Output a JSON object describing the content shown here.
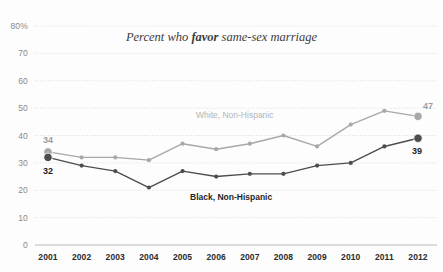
{
  "chart_data": {
    "type": "line",
    "title": "Percent who favor same-sex marriage",
    "title_prefix": "Percent who ",
    "title_emphasis": "favor",
    "title_suffix": " same-sex marriage",
    "xlabel": "",
    "ylabel": "",
    "categories": [
      "2001",
      "2002",
      "2003",
      "2004",
      "2005",
      "2006",
      "2007",
      "2008",
      "2009",
      "2010",
      "2011",
      "2012"
    ],
    "ylim": [
      0,
      80
    ],
    "yticks": [
      "0",
      "10",
      "20",
      "30",
      "40",
      "50",
      "60",
      "70",
      "80%"
    ],
    "ytick_values": [
      0,
      10,
      20,
      30,
      40,
      50,
      60,
      70,
      80
    ],
    "grid": true,
    "legend_position": "inline",
    "series": [
      {
        "name": "White, Non-Hispanic",
        "color": "#a8a8a8",
        "values": [
          34,
          32,
          32,
          31,
          37,
          35,
          37,
          40,
          36,
          44,
          49,
          47
        ],
        "start_label": "34",
        "end_label": "47"
      },
      {
        "name": "Black, Non-Hispanic",
        "color": "#4d4d4d",
        "values": [
          32,
          29,
          27,
          21,
          27,
          25,
          26,
          26,
          29,
          30,
          36,
          39
        ],
        "start_label": "32",
        "end_label": "39"
      }
    ],
    "annotations": [
      {
        "text": "White, Non-Hispanic",
        "color": "#b4b4b4"
      },
      {
        "text": "Black, Non-Hispanic",
        "color": "#262626"
      }
    ],
    "colors": {
      "background": "#fdfdfd",
      "grid": "#dedede",
      "axis_text": "#8a8a8a",
      "xaxis_text": "#2b2b2b",
      "title_text": "#3c3c3c",
      "series_light": "#a8a8a8",
      "series_dark": "#4d4d4d"
    }
  }
}
